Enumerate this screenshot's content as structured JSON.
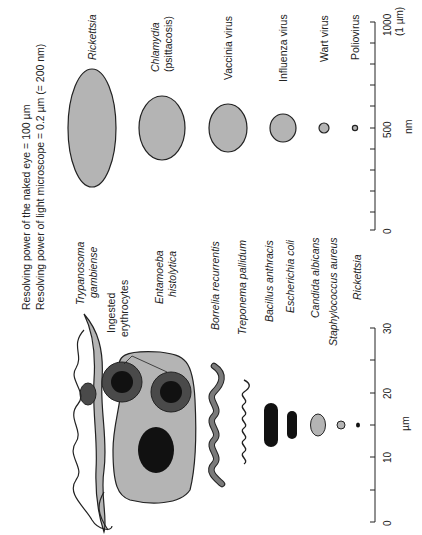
{
  "figure": {
    "orientation": "rotated 90 degrees counter-clockwise",
    "resolving_power": {
      "naked_eye": "Resolving power of the naked eye = 100 µm",
      "light_microscope": "Resolving power of light microscope = 0.2 µm (= 200 nm)"
    },
    "colors": {
      "light_fill": "#b4b4b4",
      "mid_fill": "#7a7a7a",
      "dark_fill": "#4a4a4a",
      "black_fill": "#111111",
      "outline": "#222222"
    },
    "nm_scale": {
      "unit": "nm",
      "ticks": [
        "0",
        "500",
        "1000"
      ],
      "top_note": "(1 µm)",
      "minor_tick_step": 100
    },
    "um_scale": {
      "unit": "µm",
      "ticks": [
        "0",
        "10",
        "20",
        "30"
      ],
      "minor_tick_step": 5
    },
    "small_organisms": [
      {
        "name": "Rickettsia",
        "italic": true,
        "size_nm": [
          300,
          1200
        ]
      },
      {
        "name": "Chlamydia",
        "sub": "(psittacosis)",
        "italic": true,
        "size_nm": [
          300,
          450
        ]
      },
      {
        "name": "Vaccinia virus",
        "italic": false,
        "size_nm": [
          250,
          300
        ]
      },
      {
        "name": "Influenza virus",
        "italic": false,
        "size_nm": [
          100,
          160
        ]
      },
      {
        "name": "Wart virus",
        "italic": false,
        "size_nm": [
          50,
          50
        ]
      },
      {
        "name": "Poliovirus",
        "italic": false,
        "size_nm": [
          25,
          25
        ]
      }
    ],
    "large_organisms": [
      {
        "name": "Trypanosoma",
        "sub": "gambiense",
        "italic": true
      },
      {
        "name": "Ingested",
        "sub": "erythrocytes",
        "italic": false,
        "annotation": true
      },
      {
        "name": "Entamoeba",
        "sub": "histolytica",
        "italic": true
      },
      {
        "name": "Borrelia recurrentis",
        "italic": true
      },
      {
        "name": "Treponema pallidum",
        "italic": true
      },
      {
        "name": "Bacillus anthracis",
        "italic": true
      },
      {
        "name": "Escherichia coli",
        "italic": true
      },
      {
        "name": "Candida albicans",
        "italic": true
      },
      {
        "name": "Staphylococcus aureus",
        "italic": true
      },
      {
        "name": "Rickettsia",
        "italic": true
      }
    ]
  }
}
